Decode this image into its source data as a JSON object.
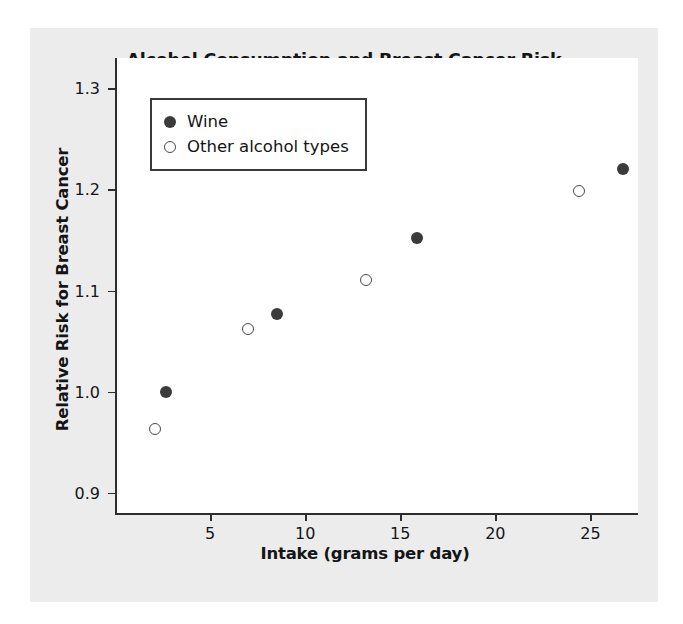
{
  "chart_data": {
    "type": "scatter",
    "title": "Alcohol Consumption and Breast Cancer Risk",
    "xlabel": "Intake (grams per day)",
    "ylabel": "Relative Risk for Breast Cancer",
    "xlim": [
      0,
      27.5
    ],
    "ylim": [
      0.88,
      1.33
    ],
    "xticks": [
      5,
      10,
      15,
      20,
      25
    ],
    "xtick_labels": [
      "5",
      "10",
      "15",
      "20",
      "25"
    ],
    "yticks": [
      0.9,
      1.0,
      1.1,
      1.2,
      1.3
    ],
    "ytick_labels": [
      "0.9",
      "1.0",
      "1.1",
      "1.2",
      "1.3"
    ],
    "grid": false,
    "legend_position": "upper left",
    "series": [
      {
        "name": "Wine",
        "marker": "filled-circle",
        "color": "#3b3b3b",
        "points": [
          {
            "x": 2.7,
            "y": 1.0
          },
          {
            "x": 8.5,
            "y": 1.077
          },
          {
            "x": 15.9,
            "y": 1.152
          },
          {
            "x": 26.7,
            "y": 1.22
          }
        ]
      },
      {
        "name": "Other alcohol types",
        "marker": "open-circle",
        "color": "#4a4a4a",
        "points": [
          {
            "x": 2.1,
            "y": 0.963
          },
          {
            "x": 7.0,
            "y": 1.062
          },
          {
            "x": 13.2,
            "y": 1.11
          },
          {
            "x": 24.4,
            "y": 1.198
          }
        ]
      }
    ]
  },
  "legend": {
    "entries": [
      {
        "label": "Wine",
        "marker": "filled-circle"
      },
      {
        "label": "Other alcohol types",
        "marker": "open-circle"
      }
    ]
  },
  "colors": {
    "figure_background": "#ececed",
    "plot_background": "#ffffff",
    "axis": "#2e2e2e",
    "text": "#151515"
  }
}
